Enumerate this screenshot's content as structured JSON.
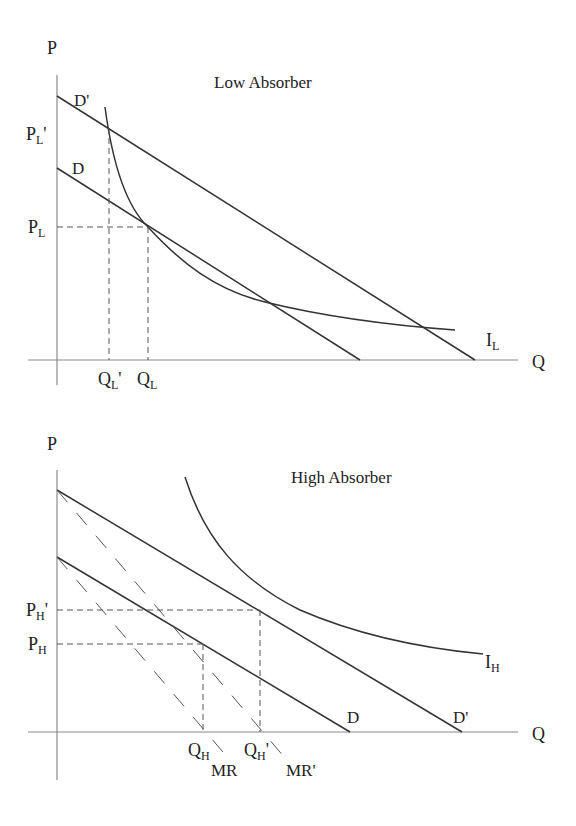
{
  "panels": {
    "low": {
      "title": "Low Absorber",
      "y_axis_label": "P",
      "x_axis_label": "Q",
      "curve_labels": {
        "demand": "D",
        "demand_shifted": "D'",
        "indifference": "I",
        "indifference_sub": "L"
      },
      "price_labels": [
        {
          "main": "P",
          "sub": "L",
          "prime": "'"
        },
        {
          "main": "P",
          "sub": "L",
          "prime": ""
        }
      ],
      "quantity_labels": [
        {
          "main": "Q",
          "sub": "L",
          "prime": "'"
        },
        {
          "main": "Q",
          "sub": "L",
          "prime": ""
        }
      ]
    },
    "high": {
      "title": "High Absorber",
      "y_axis_label": "P",
      "x_axis_label": "Q",
      "curve_labels": {
        "demand": "D",
        "demand_shifted": "D'",
        "marginal_revenue": "MR",
        "marginal_revenue_shifted": "MR'",
        "indifference": "I",
        "indifference_sub": "H"
      },
      "price_labels": [
        {
          "main": "P",
          "sub": "H",
          "prime": "'"
        },
        {
          "main": "P",
          "sub": "H",
          "prime": ""
        }
      ],
      "quantity_labels": [
        {
          "main": "Q",
          "sub": "H",
          "prime": ""
        },
        {
          "main": "Q",
          "sub": "H",
          "prime": "'"
        }
      ]
    }
  },
  "colors": {
    "axis": "#8a8a8a",
    "curve": "#333333",
    "text": "#222222",
    "background": "#ffffff"
  }
}
